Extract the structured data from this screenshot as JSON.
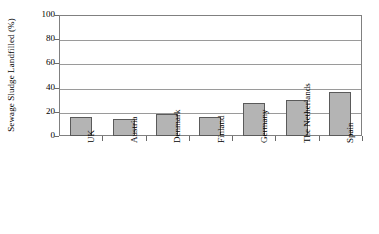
{
  "chart_data": {
    "type": "bar",
    "title": "",
    "xlabel": "",
    "ylabel": "Sewage Sludge Landfilled (%)",
    "categories": [
      "UK",
      "Austria",
      "Denmark",
      "Finland",
      "Germany",
      "The Netherlands",
      "Spain"
    ],
    "values": [
      16,
      14,
      18,
      16,
      27,
      30,
      36
    ],
    "ylim": [
      0,
      100
    ],
    "yticks": [
      0,
      20,
      40,
      60,
      80,
      100
    ],
    "ytick_labels": [
      "0",
      "20",
      "40",
      "60",
      "80",
      "100"
    ],
    "grid": true,
    "legend": false,
    "bar_color": "#b4b4b4",
    "bar_border_color": "#5a5a5a",
    "gridline_color": "#9a9a9a",
    "axis_color": "#808080"
  },
  "axis": {
    "y_title": "Sewage Sludge Landfilled (%)"
  }
}
